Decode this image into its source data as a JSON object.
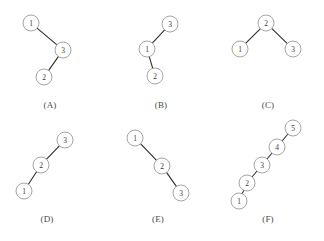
{
  "figure": {
    "width": 324,
    "height": 241,
    "background_color": "#ffffff",
    "edge_color": "#2e2e2a",
    "node_stroke_color": "#9a9a95",
    "node_fill_color": "#ffffff",
    "node_text_color": "#3a3a36",
    "caption_color": "#4a4a46",
    "node_radius": 8
  },
  "panels": [
    {
      "id": "panel-a",
      "caption": "(A)",
      "caption_x": 50,
      "caption_y": 100,
      "nodes": [
        {
          "label": "1",
          "x": 31,
          "y": 23
        },
        {
          "label": "3",
          "x": 63,
          "y": 50
        },
        {
          "label": "2",
          "x": 44,
          "y": 77
        }
      ],
      "edges": [
        {
          "from": "1",
          "to": "3"
        },
        {
          "from": "3",
          "to": "2"
        }
      ]
    },
    {
      "id": "panel-b",
      "caption": "(B)",
      "caption_x": 161,
      "caption_y": 100,
      "nodes": [
        {
          "label": "3",
          "x": 170,
          "y": 24
        },
        {
          "label": "1",
          "x": 147,
          "y": 49
        },
        {
          "label": "2",
          "x": 155,
          "y": 76
        }
      ],
      "edges": [
        {
          "from": "3",
          "to": "1"
        },
        {
          "from": "1",
          "to": "2"
        }
      ]
    },
    {
      "id": "panel-c",
      "caption": "(C)",
      "caption_x": 268,
      "caption_y": 100,
      "nodes": [
        {
          "label": "2",
          "x": 266,
          "y": 23
        },
        {
          "label": "1",
          "x": 240,
          "y": 49
        },
        {
          "label": "3",
          "x": 293,
          "y": 49
        }
      ],
      "edges": [
        {
          "from": "2",
          "to": "1"
        },
        {
          "from": "2",
          "to": "3"
        }
      ]
    },
    {
      "id": "panel-d",
      "caption": "(D)",
      "caption_x": 47,
      "caption_y": 214,
      "nodes": [
        {
          "label": "3",
          "x": 65,
          "y": 140
        },
        {
          "label": "2",
          "x": 41,
          "y": 165
        },
        {
          "label": "1",
          "x": 24,
          "y": 191
        }
      ],
      "edges": [
        {
          "from": "3",
          "to": "2"
        },
        {
          "from": "2",
          "to": "1"
        }
      ]
    },
    {
      "id": "panel-e",
      "caption": "(E)",
      "caption_x": 158,
      "caption_y": 214,
      "nodes": [
        {
          "label": "1",
          "x": 135,
          "y": 138
        },
        {
          "label": "2",
          "x": 162,
          "y": 166
        },
        {
          "label": "3",
          "x": 181,
          "y": 193
        }
      ],
      "edges": [
        {
          "from": "1",
          "to": "2"
        },
        {
          "from": "2",
          "to": "3"
        }
      ]
    },
    {
      "id": "panel-f",
      "caption": "(F)",
      "caption_x": 268,
      "caption_y": 214,
      "nodes": [
        {
          "label": "5",
          "x": 293,
          "y": 128
        },
        {
          "label": "4",
          "x": 277,
          "y": 147
        },
        {
          "label": "3",
          "x": 262,
          "y": 165
        },
        {
          "label": "2",
          "x": 247,
          "y": 183
        },
        {
          "label": "1",
          "x": 239,
          "y": 201
        }
      ],
      "edges": [
        {
          "from": "5",
          "to": "4"
        },
        {
          "from": "4",
          "to": "3"
        },
        {
          "from": "3",
          "to": "2"
        },
        {
          "from": "2",
          "to": "1"
        }
      ]
    }
  ]
}
